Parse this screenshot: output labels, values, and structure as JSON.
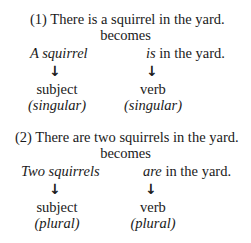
{
  "examples": [
    {
      "sentence": "(1) There is a squirrel in the yard.",
      "connector": "becomes",
      "subject_phrase": "A squirrel",
      "verb_word": "is",
      "verb_rest": " in the yard.",
      "arrow_icon": "↓",
      "subject_label": "subject",
      "subject_number": "(singular)",
      "verb_label": "verb",
      "verb_number": "(singular)"
    },
    {
      "sentence": "(2) There are two squirrels in the yard.",
      "connector": "becomes",
      "subject_phrase": "Two squirrels",
      "verb_word": "are",
      "verb_rest": " in the yard.",
      "arrow_icon": "↓",
      "subject_label": "subject",
      "subject_number": "(plural)",
      "verb_label": "verb",
      "verb_number": "(plural)"
    }
  ]
}
